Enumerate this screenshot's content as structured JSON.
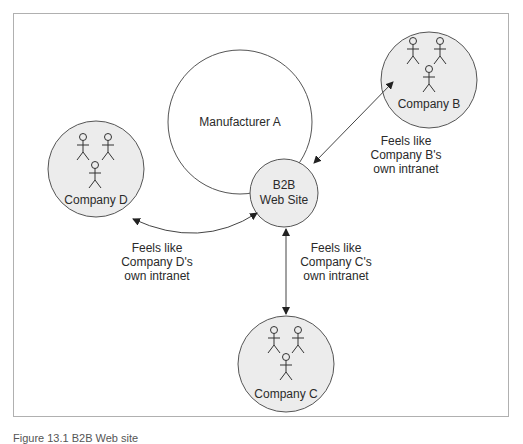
{
  "diagram": {
    "title": "B2B Web Site",
    "frame": {
      "border_color": "#b0b0b0"
    },
    "colors": {
      "node_fill": "#ececec",
      "stroke": "#555555",
      "text": "#2a2a2a",
      "arrow": "#333333"
    },
    "nodes": {
      "manufacturer": {
        "label": "Manufacturer A"
      },
      "b2b_site": {
        "line1": "B2B",
        "line2": "Web Site"
      },
      "company_b": {
        "label": "Company B"
      },
      "company_c": {
        "label": "Company C"
      },
      "company_d": {
        "label": "Company D"
      }
    },
    "edges": {
      "b": {
        "line1": "Feels like",
        "line2": "Company B's",
        "line3": "own intranet"
      },
      "c": {
        "line1": "Feels like",
        "line2": "Company C's",
        "line3": "own intranet"
      },
      "d": {
        "line1": "Feels like",
        "line2": "Company D's",
        "line3": "own intranet"
      }
    },
    "caption": "Figure 13.1 B2B Web site"
  }
}
